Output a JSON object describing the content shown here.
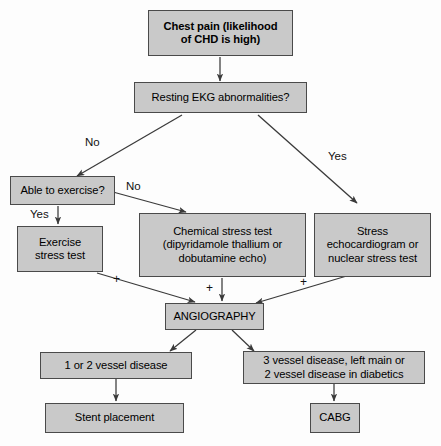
{
  "diagram": {
    "colors": {
      "node_fill": "#c9c9c9",
      "node_border": "#4a4a4a",
      "background": "#fdfdfd",
      "line": "#3a3a3a"
    },
    "nodes": [
      {
        "id": "chest_pain",
        "label": "Chest pain (likelihood of CHD is high)",
        "line1": "Chest pain (likelihood",
        "line2": "of CHD is high)"
      },
      {
        "id": "resting_ekg",
        "label": "Resting EKG abnormalities?"
      },
      {
        "id": "able_exercise",
        "label": "Able to exercise?"
      },
      {
        "id": "exercise_stress",
        "label": "Exercise stress test",
        "line1": "Exercise",
        "line2": "stress test"
      },
      {
        "id": "chemical_stress",
        "label": "Chemical stress test (dipyridamole thallium or dobutamine echo)",
        "line1": "Chemical stress test",
        "line2": "(dipyridamole thallium or",
        "line3": "dobutamine echo)"
      },
      {
        "id": "stress_echo",
        "label": "Stress echocardiogram or nuclear stress test",
        "line1": "Stress",
        "line2": "echocardiogram or",
        "line3": "nuclear stress test"
      },
      {
        "id": "angiography",
        "label": "ANGIOGRAPHY"
      },
      {
        "id": "one_two_vessel",
        "label": "1 or 2 vessel disease"
      },
      {
        "id": "three_vessel",
        "label": "3 vessel disease, left main or 2 vessel disease in diabetics",
        "line1": "3 vessel disease, left main or",
        "line2": "2 vessel disease in diabetics"
      },
      {
        "id": "stent",
        "label": "Stent placement"
      },
      {
        "id": "cabg",
        "label": "CABG"
      }
    ],
    "edge_labels": {
      "ekg_no": "No",
      "ekg_yes": "Yes",
      "exercise_no": "No",
      "exercise_yes": "Yes",
      "plus_left": "+",
      "plus_center": "+",
      "plus_right": "+"
    }
  }
}
